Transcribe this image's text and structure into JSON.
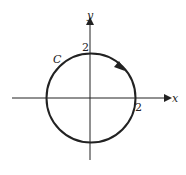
{
  "diagram": {
    "axes": {
      "x_label": "x",
      "y_label": "y"
    },
    "curve": {
      "label": "C",
      "shape": "circle",
      "radius": 2,
      "center": [
        0,
        0
      ],
      "orientation": "clockwise"
    },
    "ticks": {
      "x_intercept": "2",
      "y_intercept": "2"
    },
    "colors": {
      "stroke": "#222222"
    }
  }
}
